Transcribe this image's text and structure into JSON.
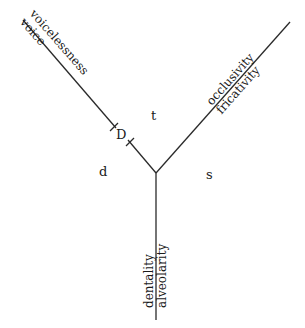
{
  "diagram": {
    "type": "feature-tree",
    "segments": {
      "d": "d",
      "t": "t",
      "s": "s",
      "D": "D"
    },
    "axes": [
      {
        "name": "voicing",
        "upper": "voicelessness",
        "lower": "voice"
      },
      {
        "name": "manner",
        "upper": "occlusivity",
        "lower": "fricativity"
      },
      {
        "name": "place",
        "left": "dentality",
        "right": "alveolarity"
      }
    ],
    "colors": {
      "line": "#2a2a2a",
      "text": "#1a1a1a",
      "background": "#ffffff"
    }
  }
}
